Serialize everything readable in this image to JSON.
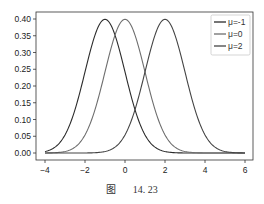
{
  "chart_data": {
    "type": "line",
    "title": "",
    "xlabel": "",
    "ylabel": "",
    "xlim": [
      -4.4,
      6.4
    ],
    "ylim": [
      -0.02,
      0.42
    ],
    "x_ticks": [
      -4,
      -2,
      0,
      2,
      4,
      6
    ],
    "x_tick_labels": [
      "-4",
      "-2",
      "0",
      "2",
      "4",
      "6"
    ],
    "y_ticks": [
      0.0,
      0.05,
      0.1,
      0.15,
      0.2,
      0.25,
      0.3,
      0.35,
      0.4
    ],
    "y_tick_labels": [
      "0.00",
      "0.05",
      "0.10",
      "0.15",
      "0.20",
      "0.25",
      "0.30",
      "0.35",
      "0.40"
    ],
    "grid": false,
    "legend_position": "upper right",
    "x": [
      -4,
      -3.5,
      -3,
      -2.5,
      -2,
      -1.5,
      -1,
      -0.5,
      0,
      0.5,
      1,
      1.5,
      2,
      2.5,
      3,
      3.5,
      4,
      4.5,
      5,
      5.5,
      6
    ],
    "series": [
      {
        "name": "μ=-1",
        "color": "#2b2b2b",
        "mean": -1,
        "std": 1,
        "values": [
          0.0044,
          0.0175,
          0.054,
          0.1295,
          0.242,
          0.3521,
          0.3989,
          0.3521,
          0.242,
          0.1295,
          0.054,
          0.0175,
          0.0044,
          0.0009,
          0.0001,
          0.0,
          0.0,
          0.0,
          0.0,
          0.0,
          0.0
        ]
      },
      {
        "name": "μ=0",
        "color": "#6e6e6e",
        "mean": 0,
        "std": 1,
        "values": [
          0.0001,
          0.0009,
          0.0044,
          0.0175,
          0.054,
          0.1295,
          0.242,
          0.3521,
          0.3989,
          0.3521,
          0.242,
          0.1295,
          0.054,
          0.0175,
          0.0044,
          0.0009,
          0.0001,
          0.0,
          0.0,
          0.0,
          0.0
        ]
      },
      {
        "name": "μ=2",
        "color": "#444444",
        "mean": 2,
        "std": 1,
        "values": [
          0.0,
          0.0,
          0.0,
          0.0,
          0.0001,
          0.0009,
          0.0044,
          0.0175,
          0.054,
          0.1295,
          0.242,
          0.3521,
          0.3989,
          0.3521,
          0.242,
          0.1295,
          0.054,
          0.0175,
          0.0044,
          0.0009,
          0.0001
        ]
      }
    ]
  },
  "legend": {
    "items": [
      {
        "label": "μ=-1",
        "color": "#2b2b2b"
      },
      {
        "label": "μ=0",
        "color": "#6e6e6e"
      },
      {
        "label": "μ=2",
        "color": "#444444"
      }
    ]
  },
  "caption": {
    "figure_label": "图",
    "figure_number": "14. 23"
  }
}
